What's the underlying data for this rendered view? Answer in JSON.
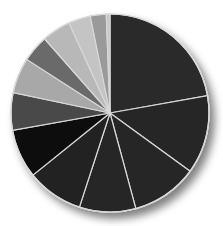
{
  "chart_data": {
    "type": "pie",
    "title": "",
    "legend": "none",
    "start_angle_deg": 0,
    "direction": "clockwise",
    "values": [
      22.2,
      12.8,
      10.8,
      9.2,
      9.2,
      8.0,
      6.1,
      5.8,
      4.4,
      4.7,
      3.6,
      2.6,
      0.6
    ],
    "colors": [
      "#2a2a2a",
      "#262626",
      "#282828",
      "#252525",
      "#232323",
      "#111111",
      "#4a4a4a",
      "#a8a8a8",
      "#6a6a6a",
      "#b8b8b8",
      "#c4c4c4",
      "#9a9a9a",
      "#c8c8c8"
    ],
    "categories": [
      "",
      "",
      "",
      "",
      "",
      "",
      "",
      "",
      "",
      "",
      "",
      "",
      ""
    ]
  }
}
